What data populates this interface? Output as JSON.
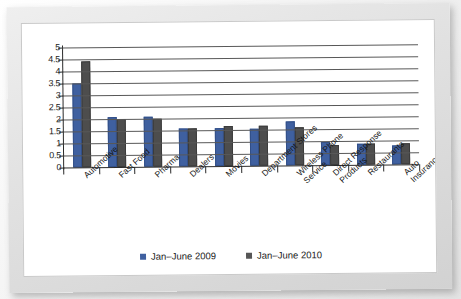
{
  "chart_data": {
    "type": "bar",
    "title": "",
    "xlabel": "",
    "ylabel": "",
    "ylim": [
      0,
      5
    ],
    "yticks": [
      "5",
      "4.5",
      "4",
      "3.5",
      "3",
      "2.5",
      "2",
      "1.5",
      "1",
      "0.5",
      "0"
    ],
    "grid": true,
    "legend_position": "bottom",
    "categories": [
      "Automotive",
      "Fast Food",
      "Pharma",
      "Dealers",
      "Movies",
      "Department Stores",
      "Wireless Phone\nService",
      "Direct Response\nProducts",
      "Restaurants",
      "Auto Insurance"
    ],
    "series": [
      {
        "name": "Jan–June 2009",
        "color": "#3f60a0",
        "values": [
          3.5,
          2.1,
          2.1,
          1.6,
          1.6,
          1.55,
          1.85,
          0.97,
          0.87,
          0.78
        ]
      },
      {
        "name": "Jan–June 2010",
        "color": "#4d4d4d",
        "values": [
          4.4,
          2.0,
          2.0,
          1.6,
          1.65,
          1.65,
          1.57,
          0.85,
          0.87,
          0.88
        ]
      }
    ]
  },
  "legend": {
    "items": [
      {
        "label": "Jan–June 2009",
        "color": "#3f60a0"
      },
      {
        "label": "Jan–June 2010",
        "color": "#565656"
      }
    ]
  }
}
